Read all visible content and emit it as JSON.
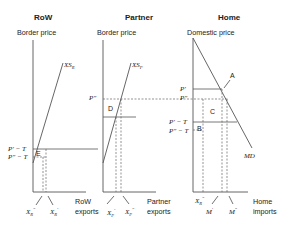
{
  "diagram": {
    "panels": [
      {
        "title": "RoW",
        "y_axis_label": "Border price",
        "x_axis_label_line1": "RoW",
        "x_axis_label_line2": "exports",
        "curve_label": "XS",
        "curve_sub": "R",
        "price_labels": [
          "P' − T",
          "P\" − T"
        ],
        "region_label": "E",
        "x_labels": [
          {
            "base": "X",
            "sub": "R",
            "sup": "\""
          },
          {
            "base": "X",
            "sub": "R",
            "sup": "'"
          }
        ]
      },
      {
        "title": "Partner",
        "y_axis_label": "Border price",
        "x_axis_label_line1": "Partner",
        "x_axis_label_line2": "exports",
        "curve_label": "XS",
        "curve_sub": "P",
        "price_labels": [
          "P\""
        ],
        "region_label": "D",
        "x_labels": [
          {
            "base": "X",
            "sub": "P",
            "sup": "'"
          },
          {
            "base": "X",
            "sub": "P",
            "sup": "\""
          }
        ]
      },
      {
        "title": "Home",
        "y_axis_label": "Domestic price",
        "x_axis_label_line1": "Home",
        "x_axis_label_line2": "imports",
        "curve_label": "MD",
        "price_labels": [
          "P'",
          "P\"",
          "P' − T",
          "P\" − T"
        ],
        "point_label": "A",
        "region_labels": [
          "C",
          "B"
        ],
        "x_labels": [
          {
            "base": "X",
            "sub": "R",
            "sup": "\""
          },
          {
            "base": "M",
            "sup": "'"
          },
          {
            "base": "M",
            "sup": "\""
          }
        ]
      }
    ]
  }
}
